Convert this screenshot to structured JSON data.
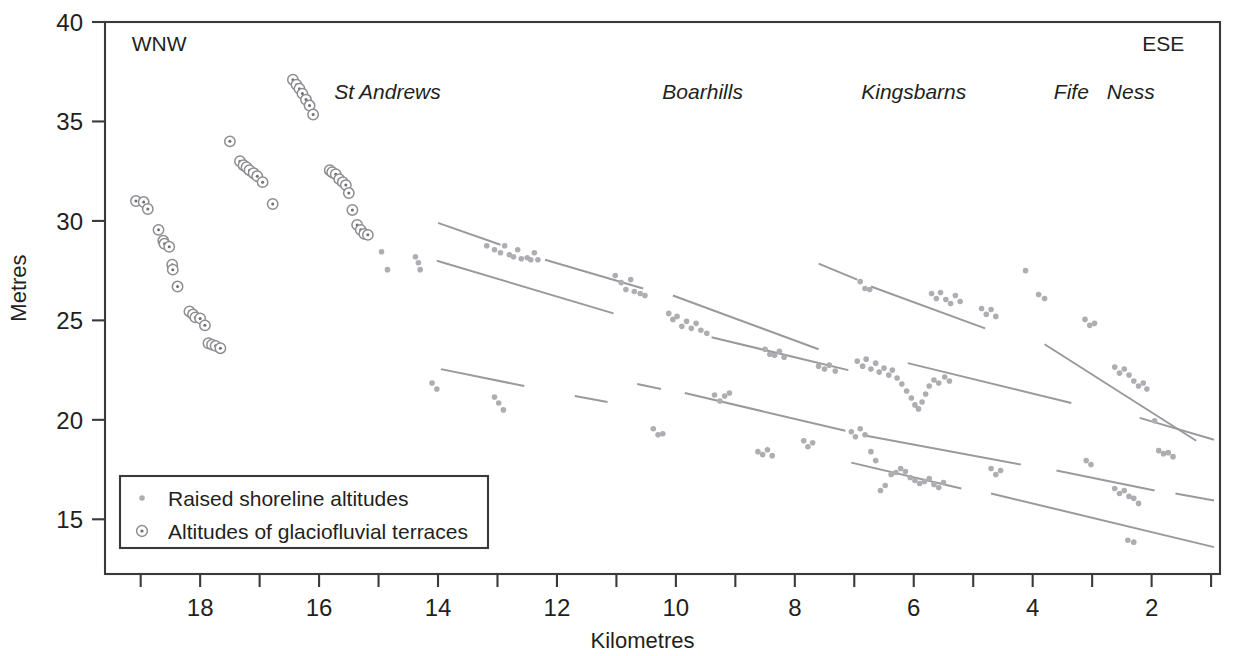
{
  "chart_data": {
    "type": "scatter",
    "title": "",
    "xlabel": "Kilometres",
    "ylabel": "Metres",
    "xlim": [
      19.6,
      0.85
    ],
    "ylim": [
      12.25,
      40.0
    ],
    "x_axis_reversed": true,
    "xticks": [
      19,
      18,
      17,
      16,
      15,
      14,
      13,
      12,
      11,
      10,
      9,
      8,
      7,
      6,
      5,
      4,
      3,
      2,
      1
    ],
    "xtick_labels": [
      "",
      "18",
      "",
      "16",
      "",
      "14",
      "",
      "12",
      "",
      "10",
      "",
      "8",
      "",
      "6",
      "",
      "4",
      "",
      "2",
      ""
    ],
    "yticks": [
      15,
      20,
      25,
      30,
      35,
      40
    ],
    "ytick_labels": [
      "15",
      "20",
      "25",
      "30",
      "35",
      "40"
    ],
    "grid": false,
    "legend_position": "bottom-left",
    "frame": "box",
    "annotations": [
      {
        "name": "wnw",
        "text": "WNW",
        "x": 19.15,
        "y": 38.55,
        "style": "upright",
        "anchor": "start"
      },
      {
        "name": "ese",
        "text": "ESE",
        "x": 1.45,
        "y": 38.55,
        "style": "upright",
        "anchor": "end"
      },
      {
        "name": "st-andrews",
        "text": "St Andrews",
        "x": 14.85,
        "y": 36.15,
        "style": "italic",
        "anchor": "middle"
      },
      {
        "name": "boarhills",
        "text": "Boarhills",
        "x": 9.55,
        "y": 36.15,
        "style": "italic",
        "anchor": "middle"
      },
      {
        "name": "kingsbarns",
        "text": "Kingsbarns",
        "x": 6.0,
        "y": 36.15,
        "style": "italic",
        "anchor": "middle"
      },
      {
        "name": "fife",
        "text": "Fife",
        "x": 3.35,
        "y": 36.15,
        "style": "italic",
        "anchor": "middle"
      },
      {
        "name": "ness",
        "text": "Ness",
        "x": 2.35,
        "y": 36.15,
        "style": "italic",
        "anchor": "middle"
      }
    ],
    "legend": {
      "entries": [
        {
          "marker": "small-dot",
          "label": "Raised shoreline altitudes"
        },
        {
          "marker": "circle-dot",
          "label": "Altitudes of glaciofluvial terraces"
        }
      ]
    },
    "series": [
      {
        "name": "Altitudes of glaciofluvial terraces",
        "marker": "circle-dot",
        "color": "#8d8d92",
        "points": [
          [
            19.08,
            31.0
          ],
          [
            18.95,
            30.95
          ],
          [
            18.88,
            30.6
          ],
          [
            18.7,
            29.55
          ],
          [
            18.62,
            29.0
          ],
          [
            18.6,
            28.85
          ],
          [
            18.52,
            28.7
          ],
          [
            18.47,
            27.8
          ],
          [
            18.46,
            27.55
          ],
          [
            18.38,
            26.7
          ],
          [
            18.18,
            25.45
          ],
          [
            18.12,
            25.3
          ],
          [
            18.08,
            25.15
          ],
          [
            18.0,
            25.1
          ],
          [
            17.92,
            24.75
          ],
          [
            17.86,
            23.85
          ],
          [
            17.8,
            23.78
          ],
          [
            17.74,
            23.72
          ],
          [
            17.66,
            23.6
          ],
          [
            17.5,
            34.0
          ],
          [
            17.33,
            33.0
          ],
          [
            17.27,
            32.8
          ],
          [
            17.22,
            32.7
          ],
          [
            17.17,
            32.55
          ],
          [
            17.1,
            32.4
          ],
          [
            17.04,
            32.25
          ],
          [
            16.95,
            31.95
          ],
          [
            16.78,
            30.85
          ],
          [
            16.44,
            37.1
          ],
          [
            16.38,
            36.85
          ],
          [
            16.33,
            36.65
          ],
          [
            16.28,
            36.4
          ],
          [
            16.22,
            36.1
          ],
          [
            16.16,
            35.8
          ],
          [
            16.1,
            35.35
          ],
          [
            15.82,
            32.55
          ],
          [
            15.78,
            32.45
          ],
          [
            15.72,
            32.35
          ],
          [
            15.66,
            32.1
          ],
          [
            15.6,
            31.95
          ],
          [
            15.55,
            31.8
          ],
          [
            15.5,
            31.4
          ],
          [
            15.44,
            30.55
          ],
          [
            15.36,
            29.8
          ],
          [
            15.3,
            29.55
          ],
          [
            15.24,
            29.35
          ],
          [
            15.18,
            29.3
          ]
        ]
      },
      {
        "name": "Raised shoreline altitudes",
        "marker": "small-dot",
        "color": "#aeaeb2",
        "points": [
          [
            14.95,
            28.45
          ],
          [
            14.85,
            27.55
          ],
          [
            14.38,
            28.2
          ],
          [
            14.33,
            27.9
          ],
          [
            14.3,
            27.55
          ],
          [
            13.18,
            28.75
          ],
          [
            13.05,
            28.55
          ],
          [
            12.95,
            28.4
          ],
          [
            12.88,
            28.75
          ],
          [
            12.8,
            28.3
          ],
          [
            12.73,
            28.2
          ],
          [
            12.66,
            28.55
          ],
          [
            12.6,
            28.1
          ],
          [
            12.5,
            28.15
          ],
          [
            12.44,
            28.05
          ],
          [
            12.38,
            28.4
          ],
          [
            12.32,
            28.05
          ],
          [
            11.02,
            27.25
          ],
          [
            10.92,
            26.9
          ],
          [
            10.84,
            26.55
          ],
          [
            10.76,
            27.05
          ],
          [
            10.7,
            26.45
          ],
          [
            10.6,
            26.35
          ],
          [
            10.52,
            26.25
          ],
          [
            10.12,
            25.35
          ],
          [
            10.05,
            25.05
          ],
          [
            9.98,
            25.2
          ],
          [
            9.9,
            24.7
          ],
          [
            9.82,
            24.95
          ],
          [
            9.74,
            24.6
          ],
          [
            9.66,
            24.85
          ],
          [
            9.58,
            24.5
          ],
          [
            9.48,
            24.35
          ],
          [
            8.5,
            23.55
          ],
          [
            8.42,
            23.3
          ],
          [
            8.34,
            23.25
          ],
          [
            8.26,
            23.45
          ],
          [
            8.18,
            23.15
          ],
          [
            7.6,
            22.7
          ],
          [
            7.5,
            22.55
          ],
          [
            7.42,
            22.75
          ],
          [
            7.32,
            22.45
          ],
          [
            6.95,
            22.95
          ],
          [
            6.86,
            22.7
          ],
          [
            6.8,
            23.05
          ],
          [
            6.72,
            22.55
          ],
          [
            6.64,
            22.85
          ],
          [
            6.58,
            22.4
          ],
          [
            6.5,
            22.6
          ],
          [
            6.42,
            22.25
          ],
          [
            6.36,
            22.5
          ],
          [
            6.28,
            22.1
          ],
          [
            6.2,
            21.8
          ],
          [
            6.12,
            21.45
          ],
          [
            6.04,
            21.1
          ],
          [
            5.98,
            20.75
          ],
          [
            5.92,
            20.55
          ],
          [
            5.86,
            20.9
          ],
          [
            5.8,
            21.3
          ],
          [
            5.74,
            21.7
          ],
          [
            5.66,
            22.0
          ],
          [
            5.58,
            21.85
          ],
          [
            5.48,
            22.15
          ],
          [
            5.4,
            21.95
          ],
          [
            6.9,
            26.95
          ],
          [
            6.82,
            26.6
          ],
          [
            6.74,
            26.55
          ],
          [
            5.7,
            26.35
          ],
          [
            5.62,
            26.1
          ],
          [
            5.55,
            26.4
          ],
          [
            5.46,
            26.05
          ],
          [
            5.38,
            25.85
          ],
          [
            5.3,
            26.25
          ],
          [
            5.22,
            25.95
          ],
          [
            4.86,
            25.6
          ],
          [
            4.78,
            25.3
          ],
          [
            4.7,
            25.55
          ],
          [
            4.62,
            25.2
          ],
          [
            4.12,
            27.5
          ],
          [
            3.9,
            26.3
          ],
          [
            3.8,
            26.1
          ],
          [
            3.12,
            25.05
          ],
          [
            3.04,
            24.75
          ],
          [
            2.96,
            24.85
          ],
          [
            2.62,
            22.65
          ],
          [
            2.54,
            22.35
          ],
          [
            2.46,
            22.55
          ],
          [
            2.38,
            22.25
          ],
          [
            2.3,
            21.95
          ],
          [
            2.22,
            21.7
          ],
          [
            2.14,
            21.85
          ],
          [
            2.08,
            21.55
          ],
          [
            1.95,
            19.95
          ],
          [
            1.88,
            18.45
          ],
          [
            1.8,
            18.3
          ],
          [
            1.72,
            18.35
          ],
          [
            1.64,
            18.15
          ],
          [
            14.1,
            21.85
          ],
          [
            14.02,
            21.55
          ],
          [
            13.05,
            21.15
          ],
          [
            12.98,
            20.85
          ],
          [
            12.9,
            20.5
          ],
          [
            10.38,
            19.55
          ],
          [
            10.3,
            19.25
          ],
          [
            10.22,
            19.3
          ],
          [
            9.35,
            21.25
          ],
          [
            9.26,
            20.95
          ],
          [
            9.18,
            21.2
          ],
          [
            9.1,
            21.35
          ],
          [
            8.62,
            18.4
          ],
          [
            8.54,
            18.25
          ],
          [
            8.46,
            18.5
          ],
          [
            8.38,
            18.2
          ],
          [
            7.85,
            18.95
          ],
          [
            7.78,
            18.65
          ],
          [
            7.7,
            18.85
          ],
          [
            7.05,
            19.4
          ],
          [
            6.98,
            19.15
          ],
          [
            6.9,
            19.55
          ],
          [
            6.82,
            19.25
          ],
          [
            6.72,
            18.4
          ],
          [
            6.64,
            17.95
          ],
          [
            6.56,
            16.45
          ],
          [
            6.48,
            16.7
          ],
          [
            6.38,
            17.25
          ],
          [
            6.3,
            17.35
          ],
          [
            6.22,
            17.55
          ],
          [
            6.14,
            17.4
          ],
          [
            6.06,
            17.1
          ],
          [
            5.98,
            16.95
          ],
          [
            5.9,
            16.8
          ],
          [
            5.82,
            16.9
          ],
          [
            5.74,
            17.05
          ],
          [
            5.66,
            16.75
          ],
          [
            5.58,
            16.6
          ],
          [
            5.5,
            16.85
          ],
          [
            4.7,
            17.55
          ],
          [
            4.62,
            17.25
          ],
          [
            4.54,
            17.45
          ],
          [
            3.1,
            17.95
          ],
          [
            3.02,
            17.75
          ],
          [
            2.62,
            16.55
          ],
          [
            2.54,
            16.3
          ],
          [
            2.46,
            16.45
          ],
          [
            2.38,
            16.15
          ],
          [
            2.3,
            16.05
          ],
          [
            2.22,
            15.8
          ],
          [
            2.4,
            13.95
          ],
          [
            2.3,
            13.85
          ]
        ]
      }
    ],
    "trend_lines": [
      {
        "name": "shoreline-1",
        "segments": [
          [
            [
              14.0,
              29.9
            ],
            [
              12.95,
              28.8
            ]
          ],
          [
            [
              12.2,
              28.05
            ],
            [
              10.55,
              26.6
            ]
          ],
          [
            [
              10.05,
              26.25
            ],
            [
              7.6,
              23.55
            ]
          ]
        ]
      },
      {
        "name": "shoreline-2",
        "segments": [
          [
            [
              14.02,
              28.0
            ],
            [
              11.05,
              25.35
            ]
          ],
          [
            [
              9.4,
              24.15
            ],
            [
              7.1,
              22.5
            ]
          ]
        ]
      },
      {
        "name": "shoreline-3",
        "segments": [
          [
            [
              7.6,
              27.85
            ],
            [
              6.95,
              27.05
            ]
          ],
          [
            [
              6.72,
              26.7
            ],
            [
              4.8,
              24.6
            ]
          ],
          [
            [
              3.8,
              23.8
            ],
            [
              1.25,
              18.95
            ]
          ]
        ]
      },
      {
        "name": "shoreline-4",
        "segments": [
          [
            [
              6.1,
              22.85
            ],
            [
              3.35,
              20.85
            ]
          ],
          [
            [
              2.2,
              20.1
            ],
            [
              0.95,
              19.0
            ]
          ]
        ]
      },
      {
        "name": "shoreline-5",
        "segments": [
          [
            [
              13.95,
              22.55
            ],
            [
              12.55,
              21.7
            ]
          ],
          [
            [
              11.7,
              21.2
            ],
            [
              11.15,
              20.9
            ]
          ]
        ]
      },
      {
        "name": "shoreline-6",
        "segments": [
          [
            [
              10.65,
              21.8
            ],
            [
              10.25,
              21.55
            ]
          ],
          [
            [
              9.85,
              21.35
            ],
            [
              7.15,
              19.45
            ]
          ]
        ]
      },
      {
        "name": "shoreline-7",
        "segments": [
          [
            [
              6.8,
              19.2
            ],
            [
              4.2,
              17.75
            ]
          ],
          [
            [
              3.6,
              17.45
            ],
            [
              1.95,
              16.45
            ]
          ],
          [
            [
              1.6,
              16.3
            ],
            [
              0.95,
              15.95
            ]
          ]
        ]
      },
      {
        "name": "shoreline-8",
        "segments": [
          [
            [
              7.05,
              17.85
            ],
            [
              5.2,
              16.55
            ]
          ],
          [
            [
              4.7,
              16.3
            ],
            [
              0.95,
              13.6
            ]
          ]
        ]
      }
    ]
  }
}
